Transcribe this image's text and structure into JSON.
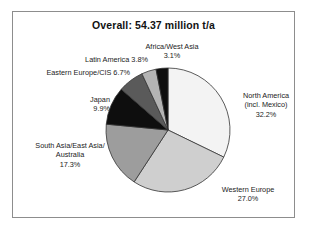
{
  "figure": {
    "title": "Overall: 54.37 million t/a",
    "frame_color": "#8d8d8d",
    "background": "#ffffff"
  },
  "chart_data": {
    "type": "pie",
    "title": "Overall: 54.37 million t/a",
    "xlabel": "",
    "ylabel": "",
    "total_label": "54.37 million t/a",
    "total_value": 54.37,
    "unit": "million t/a",
    "legend": "none (direct labels)",
    "start_angle_deg": 90,
    "direction": "clockwise",
    "categories": [
      "North America (incl. Mexico)",
      "Western Europe",
      "South Asia/East Asia/Australia",
      "Japan",
      "Eastern Europe/CIS",
      "Latin America",
      "Africa/West Asia"
    ],
    "values": [
      32.2,
      27.0,
      17.3,
      9.9,
      6.7,
      3.8,
      3.1
    ],
    "value_unit": "percent",
    "colors": [
      "#f3f3f3",
      "#cfcfcf",
      "#9d9d9d",
      "#0e0e0e",
      "#5a5a5a",
      "#b4b4b4",
      "#0e0e0e"
    ],
    "slices": [
      {
        "name": "North America (incl. Mexico)",
        "name_line1": "North America",
        "name_line2": "(incl. Mexico)",
        "percent": "32.2%",
        "value": 32.2,
        "color": "#f3f3f3"
      },
      {
        "name": "Western Europe",
        "name_line1": "Western Europe",
        "name_line2": "",
        "percent": "27.0%",
        "value": 27.0,
        "color": "#cfcfcf"
      },
      {
        "name": "South Asia/East Asia/Australia",
        "name_line1": "South Asia/East Asia/",
        "name_line2": "Australia",
        "percent": "17.3%",
        "value": 17.3,
        "color": "#9d9d9d"
      },
      {
        "name": "Japan",
        "name_line1": "Japan",
        "name_line2": "",
        "percent": "9.9%",
        "value": 9.9,
        "color": "#0e0e0e"
      },
      {
        "name": "Eastern Europe/CIS",
        "name_line1": "Eastern Europe/CIS",
        "name_line2": "",
        "percent": "6.7%",
        "value": 6.7,
        "color": "#5a5a5a"
      },
      {
        "name": "Latin America",
        "name_line1": "Latin America",
        "name_line2": "",
        "percent": "3.8%",
        "value": 3.8,
        "color": "#b4b4b4"
      },
      {
        "name": "Africa/West Asia",
        "name_line1": "Africa/West Asia",
        "name_line2": "",
        "percent": "3.1%",
        "value": 3.1,
        "color": "#0e0e0e"
      }
    ]
  }
}
